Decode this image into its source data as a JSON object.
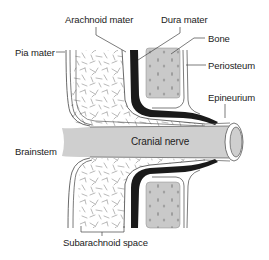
{
  "figure": {
    "type": "anatomical-cross-section",
    "colors": {
      "nerve_fill": "#cfcfcf",
      "bone_fill": "#c9c9c9",
      "dura_fill": "#1a1a1a",
      "outline": "#444444",
      "background": "#ffffff",
      "subarachnoid_texture": "#8a8a8a"
    }
  },
  "labels": {
    "arachnoid_mater": "Arachnoid mater",
    "dura_mater": "Dura mater",
    "bone": "Bone",
    "periosteum": "Periosteum",
    "epineurium": "Epineurium",
    "pia_mater": "Pia mater",
    "brainstem": "Brainstem",
    "cranial_nerve": "Cranial nerve",
    "subarachnoid_space": "Subarachnoid space"
  }
}
